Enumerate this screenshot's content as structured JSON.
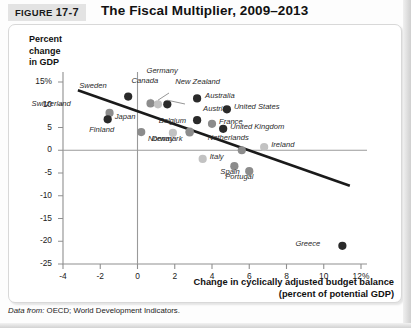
{
  "figure": {
    "tag_prefix": "FIGURE",
    "tag_number": "17-7",
    "title": "The Fiscal Multiplier, 2009–2013",
    "source_prefix": "Data from:",
    "source_text": "OECD; World Development Indicators."
  },
  "chart_data": {
    "type": "scatter",
    "title": "The Fiscal Multiplier, 2009–2013",
    "ylabel": "Percent change in GDP",
    "ylabel_lines": [
      "Percent",
      "change",
      "in GDP"
    ],
    "xlabel": "Change in cyclically adjusted budget balance (percent of potential GDP)",
    "xlabel_lines": [
      "Change in cyclically adjusted budget balance",
      "(percent of potential GDP)"
    ],
    "xlim": [
      -4,
      12
    ],
    "ylim": [
      -25,
      15
    ],
    "xticks": [
      "-4",
      "-2",
      "0",
      "2",
      "4",
      "6",
      "8",
      "10",
      "12%"
    ],
    "xtick_values": [
      -4,
      -2,
      0,
      2,
      4,
      6,
      8,
      10,
      12
    ],
    "yticks": [
      "15%",
      "10",
      "5",
      "0",
      "-5",
      "-10",
      "-15",
      "-20",
      "-25"
    ],
    "ytick_values": [
      15,
      10,
      5,
      0,
      -5,
      -10,
      -15,
      -20,
      -25
    ],
    "grid": false,
    "legend": "none",
    "zero_lines": {
      "x": 0,
      "y": 0
    },
    "trendline": {
      "x1": -3.2,
      "y1": 13.2,
      "x2": 11.4,
      "y2": -7.8,
      "label": ""
    },
    "points": [
      {
        "name": "Sweden",
        "x": -0.5,
        "y": 11.8,
        "shade": "dark",
        "label_dx": -34,
        "label_dy": -12
      },
      {
        "name": "Switzerland",
        "x": -1.5,
        "y": 8.2,
        "shade": "mid",
        "label_dx": -51,
        "label_dy": -10
      },
      {
        "name": "Japan",
        "x": -1.6,
        "y": 6.8,
        "shade": "dark",
        "label_dx": 7,
        "label_dy": -3
      },
      {
        "name": "Finland",
        "x": 0.2,
        "y": 4.0,
        "shade": "mid",
        "label_dx": -39,
        "label_dy": -3
      },
      {
        "name": "Canada",
        "x": 0.7,
        "y": 10.3,
        "shade": "mid",
        "label_dx": -13,
        "label_dy": -23
      },
      {
        "name": "Germany",
        "x": 1.1,
        "y": 10.1,
        "shade": "light",
        "label_dx": 0,
        "label_dy": -34
      },
      {
        "name": "New Zealand",
        "x": 1.6,
        "y": 10.1,
        "shade": "dark",
        "label_dx": 5,
        "label_dy": -23
      },
      {
        "name": "Australia",
        "x": 3.2,
        "y": 11.4,
        "shade": "dark",
        "label_dx": 8,
        "label_dy": -3
      },
      {
        "name": "Norway",
        "x": 1.9,
        "y": 3.8,
        "shade": "light",
        "label_dx": -11,
        "label_dy": 5
      },
      {
        "name": "Belgium",
        "x": 2.8,
        "y": 4.1,
        "shade": "mid",
        "label_dx": -16,
        "label_dy": -12
      },
      {
        "name": "Denmark",
        "x": 2.8,
        "y": 3.9,
        "shade": "mid",
        "label_dx": -19,
        "label_dy": 5
      },
      {
        "name": "Austria",
        "x": 3.2,
        "y": 6.6,
        "shade": "dark",
        "label_dx": 6,
        "label_dy": -12
      },
      {
        "name": "France",
        "x": 4.0,
        "y": 5.8,
        "shade": "mid",
        "label_dx": 7,
        "label_dy": -3
      },
      {
        "name": "United States",
        "x": 4.8,
        "y": 9.0,
        "shade": "dark",
        "label_dx": 7,
        "label_dy": -3
      },
      {
        "name": "United Kingdom",
        "x": 4.6,
        "y": 4.7,
        "shade": "dark",
        "label_dx": 7,
        "label_dy": -3
      },
      {
        "name": "Italy",
        "x": 3.5,
        "y": -1.9,
        "shade": "light",
        "label_dx": 7,
        "label_dy": -3
      },
      {
        "name": "Netherlands",
        "x": 5.6,
        "y": 0.0,
        "shade": "mid",
        "label_dx": -5,
        "label_dy": -13
      },
      {
        "name": "Ireland",
        "x": 6.8,
        "y": 0.7,
        "shade": "light",
        "label_dx": 7,
        "label_dy": -3
      },
      {
        "name": "Spain",
        "x": 5.2,
        "y": -3.5,
        "shade": "mid",
        "label_dx": -7,
        "label_dy": 5
      },
      {
        "name": "Portugal",
        "x": 6.0,
        "y": -4.6,
        "shade": "mid",
        "label_dx": -8,
        "label_dy": 5
      },
      {
        "name": "Greece",
        "x": 11.0,
        "y": -21.0,
        "shade": "dark",
        "label_dx": -34,
        "label_dy": -3
      }
    ],
    "colors": {
      "dark": "#2a2a2a",
      "mid": "#8c8c8c",
      "light": "#c2c2c2",
      "trendline": "#1a1a1a",
      "axis": "#8f8f8f",
      "text": "#1a1a1a"
    }
  }
}
